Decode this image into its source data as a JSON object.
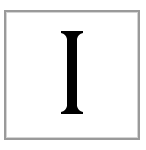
{
  "tile": {
    "letter": "I",
    "letter_color": "#000000",
    "border_color": "#9a9a9a",
    "background_color": "#ffffff"
  }
}
